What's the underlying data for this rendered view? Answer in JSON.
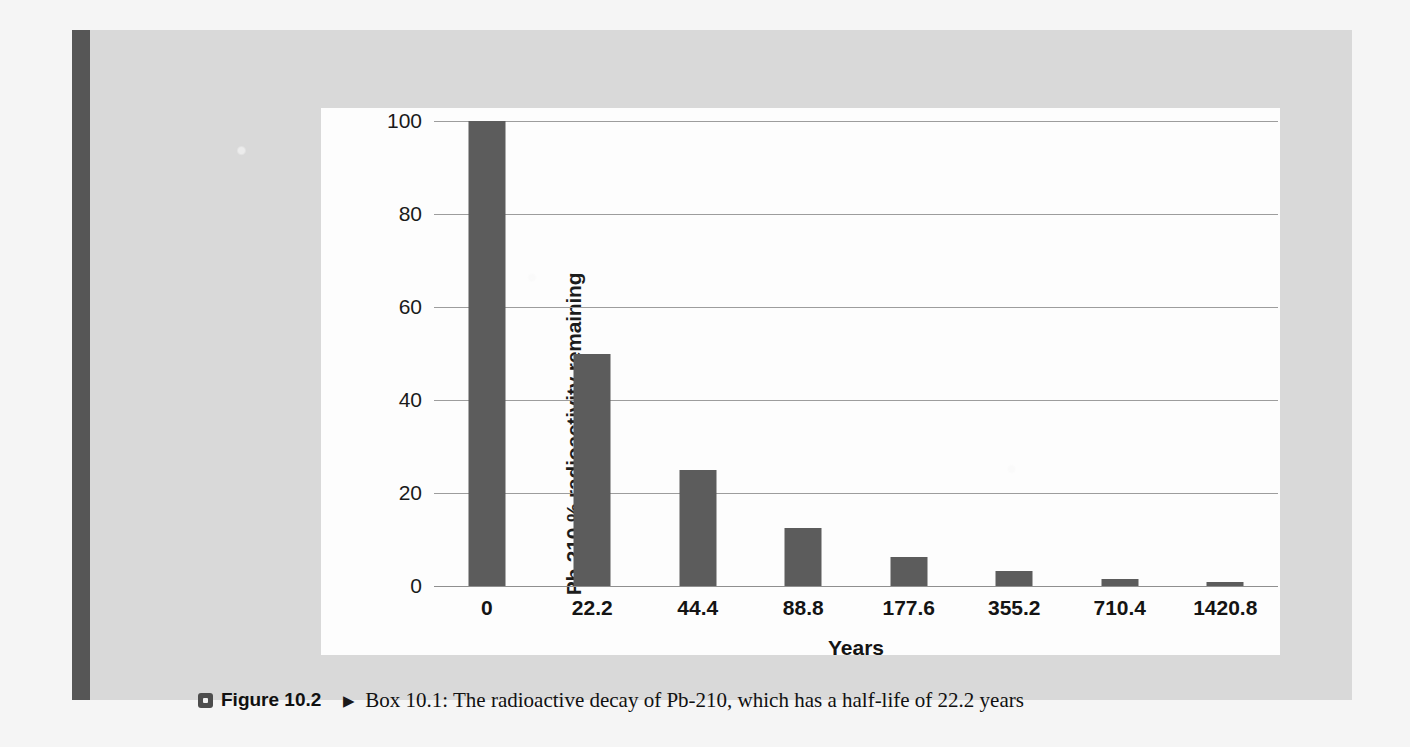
{
  "figure": {
    "bullet_icon": "square-bullet-icon",
    "number_label": "Figure 10.2",
    "arrow_icon": "▶",
    "caption_text": "Box 10.1: The radioactive decay of Pb-210, which has a half-life of 22.2 years"
  },
  "colors": {
    "bar": "#5c5c5c",
    "panel": "#d9d9d9",
    "plate": "#fdfdfd",
    "spine": "#565656",
    "gridline": "#9d9d9d",
    "text": "#141414"
  },
  "chart_data": {
    "type": "bar",
    "title": "",
    "xlabel": "Years",
    "ylabel": "Pb-210 % radioactivity remaining",
    "categories": [
      "0",
      "22.2",
      "44.4",
      "88.8",
      "177.6",
      "355.2",
      "710.4",
      "1420.8"
    ],
    "values": [
      100,
      50,
      25,
      12.5,
      6.25,
      3.125,
      1.5625,
      0.78
    ],
    "ylim": [
      0,
      100
    ],
    "yticks": [
      0,
      20,
      40,
      60,
      80,
      100
    ],
    "ytick_labels": [
      "0",
      "20",
      "40",
      "60",
      "80",
      "100"
    ],
    "grid": true,
    "legend": false,
    "legend_position": "none",
    "series": [
      {
        "name": "Pb-210 % radioactivity remaining",
        "values": [
          100,
          50,
          25,
          12.5,
          6.25,
          3.125,
          1.5625,
          0.78
        ]
      }
    ]
  }
}
